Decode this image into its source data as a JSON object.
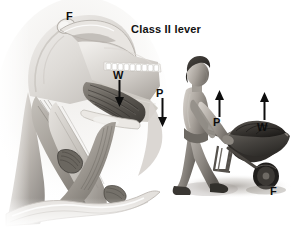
{
  "figure": {
    "title": "Class II lever",
    "background_color": "#ffffff",
    "ink_color": "#0d0d0d",
    "width": 293,
    "height": 229
  },
  "left_panel": {
    "name": "jaw-skull-illustration",
    "description": "Grayscale anatomical drawing of a human skull, mandible and neck muscles shown in lateral view",
    "labels": [
      {
        "text": "F",
        "meaning": "fulcrum",
        "x": 66,
        "y": 11
      },
      {
        "text": "W",
        "meaning": "weight",
        "x": 113,
        "y": 70
      },
      {
        "text": "P",
        "meaning": "pull",
        "x": 156,
        "y": 88
      }
    ],
    "arrows": [
      {
        "name": "weight-arrow-down",
        "direction": "down",
        "x": 118,
        "y": 80,
        "length": 26
      },
      {
        "name": "pull-arrow-down",
        "direction": "down",
        "x": 161,
        "y": 98,
        "length": 28
      }
    ]
  },
  "right_panel": {
    "name": "wheelbarrow-illustration",
    "description": "Grayscale drawing of a man walking while pushing a loaded wheelbarrow",
    "labels": [
      {
        "text": "P",
        "meaning": "pull",
        "x": 214,
        "y": 117
      },
      {
        "text": "W",
        "meaning": "weight",
        "x": 259,
        "y": 122
      },
      {
        "text": "F",
        "meaning": "fulcrum",
        "x": 270,
        "y": 186
      }
    ],
    "arrows": [
      {
        "name": "pull-arrow-up",
        "direction": "up",
        "x": 219,
        "y": 90,
        "length": 25
      },
      {
        "name": "weight-arrow-up",
        "direction": "up",
        "x": 264,
        "y": 92,
        "length": 28
      }
    ]
  },
  "legend_meanings": {
    "F": "Fulcrum",
    "W": "Weight (resistance)",
    "P": "Pull (effort)"
  }
}
